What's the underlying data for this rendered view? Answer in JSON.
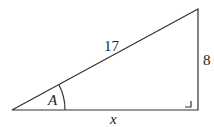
{
  "diagram": {
    "type": "right-triangle",
    "hypotenuse_label": "17",
    "opposite_label": "8",
    "adjacent_label": "x",
    "angle_label": "A",
    "line_color": "#333333"
  }
}
